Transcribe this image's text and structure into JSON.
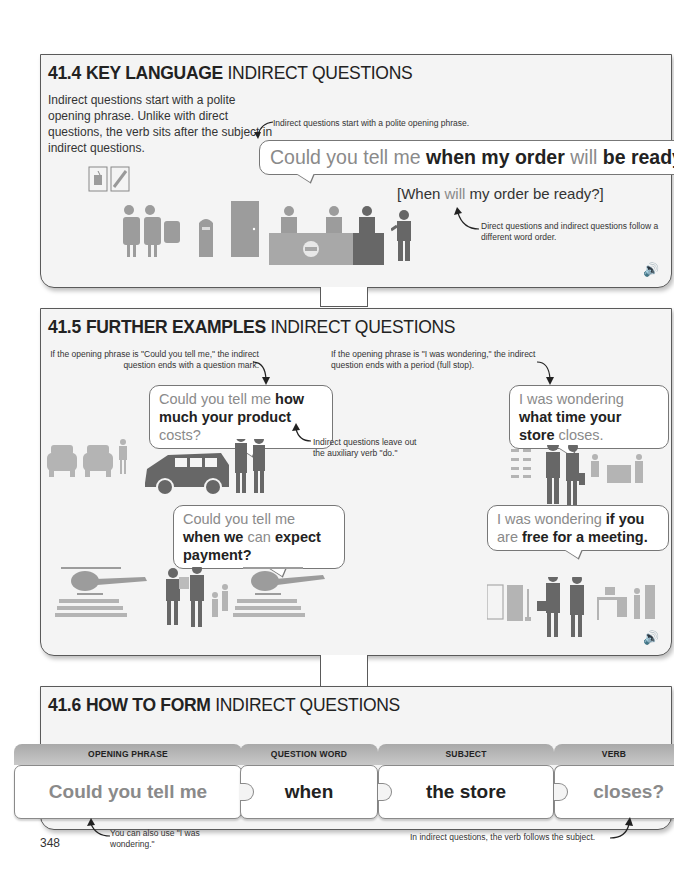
{
  "sections": {
    "key_language": {
      "number": "41.4",
      "title_bold": "KEY LANGUAGE",
      "title_rest": "INDIRECT QUESTIONS",
      "intro": "Indirect questions start with a polite opening phrase. Unlike with direct questions, the verb sits after the subject in indirect questions.",
      "note_top": "Indirect questions start with a polite opening phrase.",
      "main_bubble": {
        "opening": "Could you tell me",
        "part1": "when my order",
        "part2": "will",
        "part3": "be ready?"
      },
      "direct_question": {
        "open": "[When",
        "verb": "will",
        "rest": "my order be ready?]"
      },
      "note_bottom": "Direct questions and indirect questions follow a different word order.",
      "audio_icon": "speaker-icon"
    },
    "further_examples": {
      "number": "41.5",
      "title_bold": "FURTHER EXAMPLES",
      "title_rest": "INDIRECT QUESTIONS",
      "note_left": "If the opening phrase is \"Could you tell me,\" the indirect question ends with a question mark.",
      "note_right": "If the opening phrase is \"I was wondering,\" the indirect question ends with a period (full stop).",
      "note_do": "Indirect questions leave out the auxiliary verb \"do.\"",
      "bubbles": [
        {
          "opening": "Could you tell me",
          "bold1": "how much your product",
          "gray1": "costs?"
        },
        {
          "opening": "I was wondering",
          "bold1": "what time your store",
          "gray1": "closes."
        },
        {
          "opening": "Could you tell me",
          "bold1": "when we",
          "gray1": "can",
          "bold2": "expect payment?"
        },
        {
          "opening": "I was wondering",
          "bold1": "if you",
          "gray1": "are",
          "bold2": "free for a meeting."
        }
      ],
      "audio_icon": "speaker-icon"
    },
    "how_to_form": {
      "number": "41.6",
      "title_bold": "HOW TO FORM",
      "title_rest": "INDIRECT QUESTIONS",
      "pieces": [
        {
          "header": "OPENING PHRASE",
          "text": "Could you tell me"
        },
        {
          "header": "QUESTION WORD",
          "text": "when"
        },
        {
          "header": "SUBJECT",
          "text": "the store"
        },
        {
          "header": "VERB",
          "text": "closes?"
        }
      ],
      "note_left": "You can also use \"I was wondering.\"",
      "note_right": "In indirect questions, the verb follows the subject."
    }
  },
  "page_number": "348"
}
